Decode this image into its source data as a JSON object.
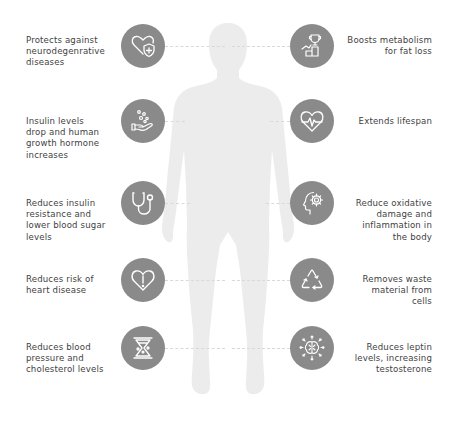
{
  "colors": {
    "badge_fill": "#8a8a8a",
    "icon_stroke": "#ffffff",
    "silhouette": "#ececec",
    "text": "#3f3f3f",
    "connector": "#d9d9d9"
  },
  "left_benefits": [
    {
      "icon": "heart-shield-icon",
      "text": "Protects against\nneurodegenrative\ndiseases"
    },
    {
      "icon": "hand-bubbles-icon",
      "text": "Insulin levels\ndrop and human\ngrowth hormone\nincreases"
    },
    {
      "icon": "stethoscope-icon",
      "text": "Reduces insulin\nresistance and\nlower blood sugar\nlevels"
    },
    {
      "icon": "heart-alert-icon",
      "text": "Reduces risk of\nheart disease"
    },
    {
      "icon": "hourglass-icon",
      "text": "Reduces blood\npressure and\ncholesterol levels"
    }
  ],
  "right_benefits": [
    {
      "icon": "trophy-growth-icon",
      "text": "Boosts metabolism\nfor fat loss"
    },
    {
      "icon": "heart-pulse-icon",
      "text": "Extends lifespan"
    },
    {
      "icon": "head-gear-icon",
      "text": "Reduce oxidative\ndamage and\ninflammation in\nthe body"
    },
    {
      "icon": "recycle-icon",
      "text": "Removes waste\nmaterial from\ncells"
    },
    {
      "icon": "brain-arrows-icon",
      "text": "Reduces leptin\nlevels, increasing\ntestosterone"
    }
  ]
}
